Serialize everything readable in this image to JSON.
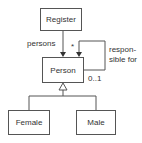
{
  "classes": {
    "register": "Register",
    "person": "Person",
    "female": "Female",
    "male": "Male"
  },
  "associations": {
    "register_person": {
      "role": "persons",
      "multiplicity": ""
    },
    "self": {
      "multiplicity_top": "*",
      "multiplicity_bottom": "0..1",
      "name_line1": "respon-",
      "name_line2": "sible for"
    }
  },
  "generalization": {
    "parent": "Person",
    "children": [
      "Female",
      "Male"
    ]
  },
  "colors": {
    "line": "#555555",
    "text": "#333333",
    "background": "#ffffff"
  }
}
